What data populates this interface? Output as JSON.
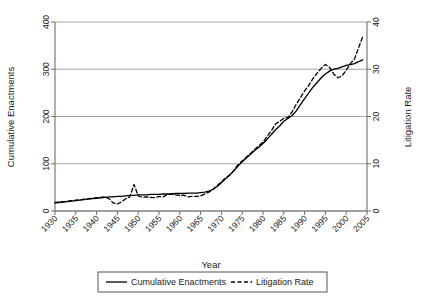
{
  "chart_data": {
    "type": "line",
    "title": "",
    "xlabel": "Year",
    "ylabel": "Cumulative Enactments",
    "y2label": "Litigation Rate",
    "xlim": [
      1930,
      2005
    ],
    "ylim": [
      0,
      400
    ],
    "y2lim": [
      0,
      40
    ],
    "xticks": [
      1930,
      1935,
      1940,
      1945,
      1950,
      1955,
      1960,
      1965,
      1970,
      1975,
      1980,
      1985,
      1990,
      1995,
      2000,
      2005
    ],
    "xtick_labels": [
      "1930",
      "1935",
      "1940",
      "1945",
      "1950",
      "1955",
      "1960",
      "1965",
      "1970",
      "1975",
      "1980",
      "1985",
      "1990",
      "1995",
      "2000",
      "2005"
    ],
    "yticks": [
      0,
      100,
      200,
      300,
      400
    ],
    "ytick_labels": [
      "0",
      "100",
      "200",
      "300",
      "400"
    ],
    "y2ticks": [
      0,
      10,
      20,
      30,
      40
    ],
    "y2tick_labels": [
      "0",
      "10",
      "20",
      "30",
      "40"
    ],
    "grid": "horizontal",
    "legend_position": "below",
    "series": [
      {
        "name": "Cumulative Enactments",
        "axis": "left",
        "style": "solid",
        "color": "#000000",
        "x": [
          1930,
          1931,
          1932,
          1933,
          1934,
          1935,
          1936,
          1937,
          1938,
          1939,
          1940,
          1941,
          1942,
          1943,
          1944,
          1945,
          1946,
          1947,
          1948,
          1949,
          1950,
          1951,
          1952,
          1953,
          1954,
          1955,
          1956,
          1957,
          1958,
          1959,
          1960,
          1961,
          1962,
          1963,
          1964,
          1965,
          1966,
          1967,
          1968,
          1969,
          1970,
          1971,
          1972,
          1973,
          1974,
          1975,
          1976,
          1977,
          1978,
          1979,
          1980,
          1981,
          1982,
          1983,
          1984,
          1985,
          1986,
          1987,
          1988,
          1989,
          1990,
          1991,
          1992,
          1993,
          1994,
          1995,
          1996,
          1997,
          1998,
          1999,
          2000,
          2001,
          2002,
          2003,
          2004
        ],
        "y": [
          17,
          18,
          19,
          20,
          21,
          22,
          23,
          24,
          25,
          26,
          27,
          28,
          29,
          30,
          30,
          31,
          31,
          32,
          33,
          33,
          34,
          34,
          34,
          35,
          35,
          35,
          36,
          36,
          36,
          37,
          37,
          37,
          38,
          38,
          38,
          39,
          40,
          42,
          46,
          52,
          60,
          68,
          76,
          85,
          95,
          104,
          112,
          120,
          128,
          135,
          143,
          152,
          162,
          172,
          180,
          190,
          196,
          202,
          212,
          225,
          238,
          250,
          262,
          272,
          282,
          290,
          296,
          300,
          302,
          305,
          308,
          310,
          312,
          316,
          320
        ]
      },
      {
        "name": "Litigation Rate",
        "axis": "right",
        "style": "dashed",
        "color": "#000000",
        "x": [
          1930,
          1931,
          1932,
          1933,
          1934,
          1935,
          1936,
          1937,
          1938,
          1939,
          1940,
          1941,
          1942,
          1943,
          1944,
          1945,
          1946,
          1947,
          1948,
          1949,
          1950,
          1951,
          1952,
          1953,
          1954,
          1955,
          1956,
          1957,
          1958,
          1959,
          1960,
          1961,
          1962,
          1963,
          1964,
          1965,
          1966,
          1967,
          1968,
          1969,
          1970,
          1971,
          1972,
          1973,
          1974,
          1975,
          1976,
          1977,
          1978,
          1979,
          1980,
          1981,
          1982,
          1983,
          1984,
          1985,
          1986,
          1987,
          1988,
          1989,
          1990,
          1991,
          1992,
          1993,
          1994,
          1995,
          1996,
          1997,
          1998,
          1999,
          2000,
          2001,
          2002,
          2003,
          2004
        ],
        "y": [
          1.8,
          1.9,
          2.0,
          2.1,
          2.2,
          2.3,
          2.4,
          2.5,
          2.6,
          2.7,
          2.8,
          2.9,
          3.0,
          2.6,
          1.7,
          1.5,
          1.9,
          2.6,
          3.0,
          5.6,
          3.2,
          2.9,
          3.0,
          2.9,
          2.8,
          3.1,
          3.0,
          3.5,
          3.6,
          3.4,
          3.3,
          3.3,
          3.0,
          3.1,
          3.1,
          3.2,
          3.6,
          4.0,
          4.6,
          5.4,
          6.2,
          7.0,
          7.6,
          8.6,
          9.8,
          10.6,
          11.4,
          12.2,
          13.0,
          13.8,
          14.6,
          15.8,
          17.0,
          18.4,
          19.0,
          19.6,
          19.8,
          21.0,
          22.6,
          24.0,
          25.4,
          26.6,
          28.0,
          29.2,
          30.2,
          31.0,
          30.4,
          29.0,
          28.2,
          28.6,
          29.8,
          31.2,
          32.2,
          34.6,
          37.0
        ]
      }
    ]
  },
  "legend": {
    "items": [
      {
        "label": "Cumulative Enactments",
        "style": "solid"
      },
      {
        "label": "Litigation Rate",
        "style": "dashed"
      }
    ]
  }
}
